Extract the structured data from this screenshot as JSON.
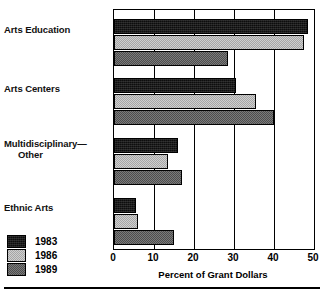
{
  "chart_data": {
    "type": "bar",
    "orientation": "horizontal",
    "title": "",
    "xlabel": "Percent of Grant Dollars",
    "ylabel": "",
    "xlim": [
      0,
      50
    ],
    "xticks": [
      0,
      10,
      20,
      30,
      40,
      50
    ],
    "xtick_labels": [
      "0",
      "10",
      "20",
      "30",
      "40",
      "50"
    ],
    "grid": true,
    "grid_axis": "x",
    "legend_position": "lower-left-outside",
    "categories": [
      "Arts Education",
      "Arts Centers",
      "Multidisciplinary—Other",
      "Ethnic Arts"
    ],
    "category_lines": [
      [
        "Arts Education"
      ],
      [
        "Arts Centers"
      ],
      [
        "Multidisciplinary—",
        "Other"
      ],
      [
        "Ethnic Arts"
      ]
    ],
    "series": [
      {
        "name": "1983",
        "color": "#0d0d0d",
        "pattern": "solid-black",
        "values": [
          48.5,
          30.5,
          16.0,
          5.5
        ]
      },
      {
        "name": "1986",
        "color": "#b9b9b9",
        "pattern": "light-checker",
        "values": [
          47.5,
          35.5,
          13.5,
          6.0
        ]
      },
      {
        "name": "1989",
        "color": "#646464",
        "pattern": "dark-checker",
        "values": [
          28.5,
          40.0,
          17.0,
          15.0
        ]
      }
    ]
  },
  "legend": {
    "items": [
      {
        "label": "1983",
        "swatch_class": "fill-1983"
      },
      {
        "label": "1986",
        "swatch_class": "fill-1986"
      },
      {
        "label": "1989",
        "swatch_class": "fill-1989"
      }
    ]
  },
  "colors": {
    "series_1983": "#0d0d0d",
    "series_1986": "#b9b9b9",
    "series_1989": "#646464",
    "axis": "#000000",
    "background": "#ffffff"
  }
}
